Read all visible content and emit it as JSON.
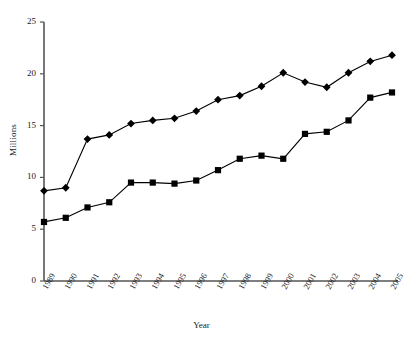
{
  "chart_data": {
    "type": "line",
    "title": "",
    "xlabel": "Year",
    "ylabel": "Millions",
    "ylim": [
      0,
      25
    ],
    "yticks": [
      0,
      5,
      10,
      15,
      20,
      25
    ],
    "grid": false,
    "legend_position": "none",
    "categories": [
      "1989",
      "1990",
      "1991",
      "1992",
      "1993",
      "1994",
      "1995",
      "1996",
      "1997",
      "1998",
      "1999",
      "2000",
      "2001",
      "2002",
      "2003",
      "2004",
      "2005"
    ],
    "series": [
      {
        "name": "Series 1",
        "marker": "diamond",
        "color": "#000000",
        "values": [
          8.7,
          9.0,
          13.7,
          14.1,
          15.2,
          15.5,
          15.7,
          16.4,
          17.5,
          17.9,
          18.8,
          20.1,
          19.2,
          18.7,
          20.1,
          21.2,
          21.8
        ]
      },
      {
        "name": "Series 2",
        "marker": "square",
        "color": "#000000",
        "values": [
          5.7,
          6.1,
          7.1,
          7.6,
          9.5,
          9.5,
          9.4,
          9.7,
          10.7,
          11.8,
          12.1,
          11.8,
          14.2,
          14.4,
          15.5,
          17.7,
          18.2
        ]
      }
    ]
  },
  "axis": {
    "y_tick_labels": [
      "0",
      "5",
      "10",
      "15",
      "20",
      "25"
    ],
    "x_tick_labels": [
      "1989",
      "1990",
      "1991",
      "1992",
      "1993",
      "1994",
      "1995",
      "1996",
      "1997",
      "1998",
      "1999",
      "2000",
      "2001",
      "2002",
      "2003",
      "2004",
      "2005"
    ]
  }
}
